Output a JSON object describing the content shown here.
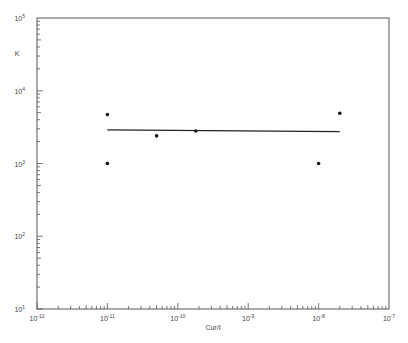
{
  "chart_data": {
    "type": "scatter",
    "title": "",
    "xlabel": "Cur/I",
    "ylabel": "K",
    "xscale": "log",
    "yscale": "log",
    "xlim": [
      1e-12,
      1e-07
    ],
    "ylim": [
      10,
      100000
    ],
    "grid": false,
    "legend": null,
    "x_ticks": [
      {
        "base": "10",
        "exp": "-12",
        "value": 1e-12
      },
      {
        "base": "10",
        "exp": "-11",
        "value": 1e-11
      },
      {
        "base": "10",
        "exp": "-10",
        "value": 1e-10
      },
      {
        "base": "10",
        "exp": "-9",
        "value": 1e-09
      },
      {
        "base": "10",
        "exp": "-8",
        "value": 1e-08
      },
      {
        "base": "10",
        "exp": "-7",
        "value": 1e-07
      }
    ],
    "y_ticks": [
      {
        "base": "10",
        "exp": "1",
        "value": 10
      },
      {
        "base": "10",
        "exp": "2",
        "value": 100
      },
      {
        "base": "10",
        "exp": "3",
        "value": 1000
      },
      {
        "base": "10",
        "exp": "4",
        "value": 10000
      },
      {
        "base": "10",
        "exp": "5",
        "value": 100000
      }
    ],
    "series": [
      {
        "name": "data",
        "kind": "scatter",
        "points": [
          {
            "x": 1e-11,
            "y": 4700
          },
          {
            "x": 1e-11,
            "y": 1000
          },
          {
            "x": 5e-11,
            "y": 2400
          },
          {
            "x": 1.8e-10,
            "y": 2800
          },
          {
            "x": 1e-08,
            "y": 1000
          },
          {
            "x": 2e-08,
            "y": 4900
          }
        ]
      },
      {
        "name": "fit",
        "kind": "line",
        "points": [
          {
            "x": 1e-11,
            "y": 2900
          },
          {
            "x": 2e-08,
            "y": 2750
          }
        ]
      }
    ]
  }
}
